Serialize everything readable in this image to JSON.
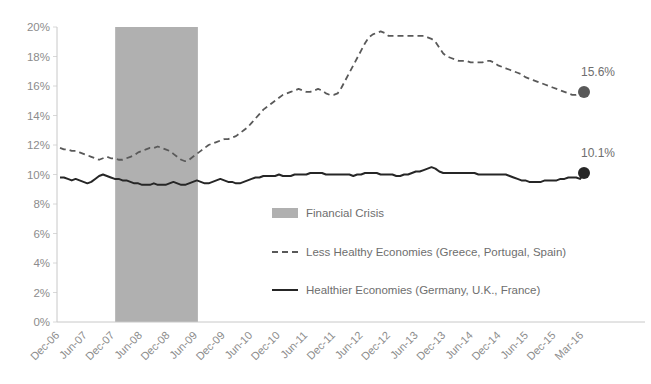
{
  "chart_data": {
    "type": "line",
    "title": "",
    "xlabel": "",
    "ylabel": "",
    "ylim": [
      0,
      20
    ],
    "ytick_labels": [
      "0%",
      "2%",
      "4%",
      "6%",
      "8%",
      "10%",
      "12%",
      "14%",
      "16%",
      "18%",
      "20%"
    ],
    "ytick_values": [
      0,
      2,
      4,
      6,
      8,
      10,
      12,
      14,
      16,
      18,
      20
    ],
    "grid": false,
    "legend_position": "center-bottom-inside",
    "xtick_labels": [
      "Dec-06",
      "Jun-07",
      "Dec-07",
      "Jun-08",
      "Dec-08",
      "Jun-09",
      "Dec-09",
      "Jun-10",
      "Dec-10",
      "Jun-11",
      "Dec-11",
      "Jun-12",
      "Dec-12",
      "Jun-13",
      "Dec-13",
      "Jun-14",
      "Dec-14",
      "Jun-15",
      "Dec-15",
      "Mar-16"
    ],
    "x_start": "Dec-06",
    "x_end": "Mar-16",
    "series": [
      {
        "name": "Less Healthy Economies (Greece, Portugal, Spain)",
        "style": "dashed",
        "color": "#595959",
        "end_label": "15.6%",
        "end_value": 15.6,
        "values": [
          11.8,
          11.7,
          11.7,
          11.6,
          11.6,
          11.5,
          11.4,
          11.3,
          11.2,
          11.1,
          11.0,
          11.1,
          11.2,
          11.1,
          11.1,
          11.0,
          11.0,
          11.1,
          11.2,
          11.3,
          11.5,
          11.6,
          11.7,
          11.8,
          11.8,
          11.9,
          11.8,
          11.7,
          11.6,
          11.4,
          11.2,
          11.0,
          10.9,
          11.0,
          11.2,
          11.4,
          11.6,
          11.8,
          12.0,
          12.1,
          12.2,
          12.3,
          12.4,
          12.4,
          12.5,
          12.6,
          12.8,
          13.0,
          13.2,
          13.5,
          13.8,
          14.1,
          14.4,
          14.6,
          14.8,
          15.0,
          15.2,
          15.4,
          15.5,
          15.6,
          15.7,
          15.8,
          15.7,
          15.6,
          15.6,
          15.7,
          15.8,
          15.7,
          15.5,
          15.4,
          15.4,
          15.5,
          15.9,
          16.4,
          16.9,
          17.4,
          17.9,
          18.4,
          18.9,
          19.3,
          19.5,
          19.6,
          19.7,
          19.6,
          19.4,
          19.4,
          19.4,
          19.4,
          19.4,
          19.4,
          19.4,
          19.4,
          19.4,
          19.4,
          19.3,
          19.2,
          19.0,
          18.6,
          18.2,
          18.0,
          17.9,
          17.8,
          17.7,
          17.7,
          17.7,
          17.6,
          17.6,
          17.6,
          17.6,
          17.7,
          17.7,
          17.6,
          17.4,
          17.3,
          17.2,
          17.1,
          17.0,
          16.9,
          16.8,
          16.6,
          16.5,
          16.4,
          16.3,
          16.2,
          16.1,
          16.0,
          15.9,
          15.8,
          15.7,
          15.6,
          15.5,
          15.4,
          15.4,
          15.5,
          15.6
        ]
      },
      {
        "name": "Healthier Economies (Germany, U.K., France)",
        "style": "solid",
        "color": "#262626",
        "end_label": "10.1%",
        "end_value": 10.1,
        "values": [
          9.8,
          9.8,
          9.7,
          9.6,
          9.7,
          9.6,
          9.5,
          9.4,
          9.5,
          9.7,
          9.9,
          10.0,
          9.9,
          9.8,
          9.7,
          9.7,
          9.6,
          9.6,
          9.5,
          9.4,
          9.4,
          9.3,
          9.3,
          9.3,
          9.4,
          9.3,
          9.3,
          9.3,
          9.4,
          9.5,
          9.4,
          9.3,
          9.3,
          9.4,
          9.5,
          9.6,
          9.5,
          9.4,
          9.4,
          9.5,
          9.6,
          9.7,
          9.6,
          9.5,
          9.5,
          9.4,
          9.4,
          9.5,
          9.6,
          9.7,
          9.8,
          9.8,
          9.9,
          9.9,
          9.9,
          9.9,
          10.0,
          9.9,
          9.9,
          9.9,
          10.0,
          10.0,
          10.0,
          10.0,
          10.1,
          10.1,
          10.1,
          10.1,
          10.0,
          10.0,
          10.0,
          10.0,
          10.0,
          10.0,
          10.0,
          9.9,
          10.0,
          10.0,
          10.1,
          10.1,
          10.1,
          10.1,
          10.0,
          10.0,
          10.0,
          10.0,
          9.9,
          9.9,
          10.0,
          10.0,
          10.1,
          10.2,
          10.2,
          10.3,
          10.4,
          10.5,
          10.4,
          10.2,
          10.1,
          10.1,
          10.1,
          10.1,
          10.1,
          10.1,
          10.1,
          10.1,
          10.1,
          10.0,
          10.0,
          10.0,
          10.0,
          10.0,
          10.0,
          10.0,
          10.0,
          9.9,
          9.8,
          9.7,
          9.6,
          9.6,
          9.5,
          9.5,
          9.5,
          9.5,
          9.6,
          9.6,
          9.6,
          9.6,
          9.7,
          9.7,
          9.8,
          9.8,
          9.8,
          9.7,
          10.1
        ]
      }
    ],
    "shaded_region": {
      "label": "Financial Crisis",
      "color": "#b0b0b0",
      "start": "Dec-07",
      "end": "Jun-09",
      "y_top": 20
    },
    "legend": [
      {
        "label": "Financial Crisis",
        "marker": "swatch",
        "color": "#b0b0b0"
      },
      {
        "label": "Less Healthy Economies (Greece, Portugal, Spain)",
        "marker": "dashed-line",
        "color": "#595959"
      },
      {
        "label": "Healthier Economies (Germany, U.K., France)",
        "marker": "solid-line",
        "color": "#262626"
      }
    ],
    "axis_color": "#c8c8c8"
  }
}
